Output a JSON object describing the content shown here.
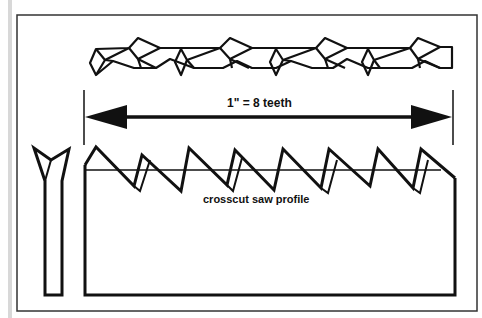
{
  "diagram": {
    "measure_label": "1\" = 8 teeth",
    "profile_label": "crosscut saw profile",
    "views": [
      "top view of set teeth",
      "end view of tooth",
      "side profile"
    ],
    "teeth_per_inch": 8,
    "colors": {
      "line": "#111111",
      "background": "#ffffff",
      "frame": "#333333",
      "left_strip": "#d8d8d8"
    }
  }
}
